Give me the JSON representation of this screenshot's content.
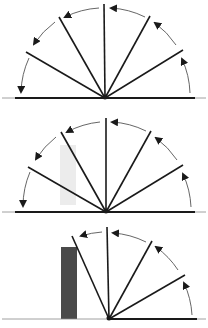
{
  "figure": {
    "colors": {
      "line": "#1a1a1a",
      "arc": "#555555",
      "obstacle": "#4a4a4a",
      "shadow": "#e6e6e6"
    },
    "panels": [
      {
        "id": "panel-1",
        "pivot": [
          105,
          98
        ],
        "radius": 92,
        "rod_angles_deg": [
          30,
          60,
          90,
          120,
          150
        ],
        "arrows": "counterclockwise from 0 to 180",
        "obstacle": false
      },
      {
        "id": "panel-2",
        "pivot": [
          106,
          212
        ],
        "radius": 92,
        "rod_angles_deg": [
          30,
          60,
          90,
          120,
          150
        ],
        "arrows": "counterclockwise from 0 to 180",
        "obstacle": false,
        "faint_shadow": true
      },
      {
        "id": "panel-3",
        "pivot": [
          109,
          319
        ],
        "radius": 92,
        "rod_angles_deg": [
          30,
          60,
          90,
          110
        ],
        "arrows": "counterclockwise from 0 to ~110, stopped by obstacle",
        "obstacle": true
      }
    ]
  }
}
